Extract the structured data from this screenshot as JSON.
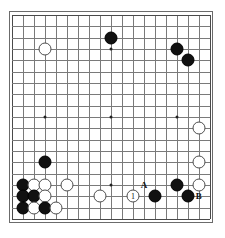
{
  "diagram": {
    "type": "go-board-diagram",
    "board_size": 19,
    "background_color": "#ffffff",
    "grid_color": "#7a7a7a",
    "frame_color": "#4a4a4a",
    "black_color": "#111111",
    "white_color": "#ffffff"
  },
  "star_points": [
    {
      "col": 4,
      "row": 4
    },
    {
      "col": 10,
      "row": 4
    },
    {
      "col": 16,
      "row": 4
    },
    {
      "col": 4,
      "row": 10
    },
    {
      "col": 10,
      "row": 10
    },
    {
      "col": 16,
      "row": 10
    },
    {
      "col": 4,
      "row": 16
    },
    {
      "col": 10,
      "row": 16
    },
    {
      "col": 16,
      "row": 16
    }
  ],
  "stones": [
    {
      "color": "black",
      "col": 10,
      "row": 3,
      "label": ""
    },
    {
      "color": "white",
      "col": 4,
      "row": 4,
      "label": ""
    },
    {
      "color": "black",
      "col": 16,
      "row": 4,
      "label": ""
    },
    {
      "color": "black",
      "col": 17,
      "row": 5,
      "label": ""
    },
    {
      "color": "white",
      "col": 18,
      "row": 11,
      "label": ""
    },
    {
      "color": "white",
      "col": 18,
      "row": 14,
      "label": ""
    },
    {
      "color": "black",
      "col": 4,
      "row": 14,
      "label": ""
    },
    {
      "color": "black",
      "col": 2,
      "row": 16,
      "label": ""
    },
    {
      "color": "white",
      "col": 3,
      "row": 16,
      "label": ""
    },
    {
      "color": "white",
      "col": 4,
      "row": 16,
      "label": ""
    },
    {
      "color": "white",
      "col": 6,
      "row": 16,
      "label": ""
    },
    {
      "color": "black",
      "col": 2,
      "row": 17,
      "label": ""
    },
    {
      "color": "black",
      "col": 3,
      "row": 17,
      "label": ""
    },
    {
      "color": "white",
      "col": 4,
      "row": 17,
      "label": ""
    },
    {
      "color": "black",
      "col": 2,
      "row": 18,
      "label": ""
    },
    {
      "color": "white",
      "col": 3,
      "row": 18,
      "label": ""
    },
    {
      "color": "black",
      "col": 4,
      "row": 18,
      "label": ""
    },
    {
      "color": "white",
      "col": 5,
      "row": 18,
      "label": ""
    },
    {
      "color": "white",
      "col": 9,
      "row": 17,
      "label": ""
    },
    {
      "color": "white",
      "col": 12,
      "row": 17,
      "label": "1"
    },
    {
      "color": "black",
      "col": 14,
      "row": 17,
      "label": ""
    },
    {
      "color": "black",
      "col": 16,
      "row": 16,
      "label": ""
    },
    {
      "color": "white",
      "col": 18,
      "row": 16,
      "label": ""
    },
    {
      "color": "black",
      "col": 17,
      "row": 17,
      "label": ""
    }
  ],
  "point_labels": [
    {
      "text": "A",
      "col": 13,
      "row": 16
    },
    {
      "text": "B",
      "col": 18,
      "row": 17
    }
  ]
}
